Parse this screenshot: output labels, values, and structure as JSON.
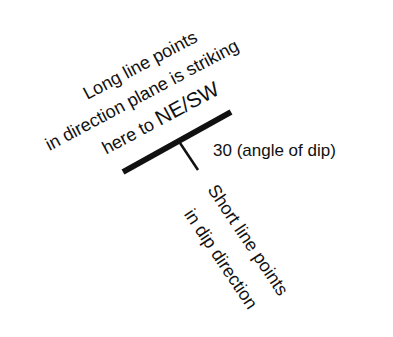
{
  "diagram": {
    "type": "strike-and-dip-symbol",
    "strike_label": {
      "lines": [
        "Long line points",
        "in direction plane is striking",
        "here to "
      ],
      "emphasis": "NE/SW"
    },
    "dip_angle_label": "30 (angle of dip)",
    "dip_label": {
      "lines": [
        "Short line points",
        "in dip direction"
      ]
    },
    "colors": {
      "background": "#ffffff",
      "ink": "#111111"
    }
  }
}
